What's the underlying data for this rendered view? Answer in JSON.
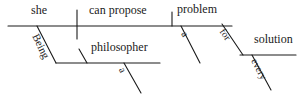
{
  "diagram": {
    "type": "reed-kellogg-sentence-diagram",
    "sentence": "Being a philosopher, she can propose a problem for every solution.",
    "ink_color": "#1a1a1a",
    "background_color": "#ffffff",
    "words": {
      "subject": "she",
      "verb": "can propose",
      "direct_object": "problem",
      "object_article": "a",
      "participle": "Being",
      "predicate_noun": "philosopher",
      "predicate_noun_article": "a",
      "preposition": "for",
      "prep_object": "solution",
      "prep_object_determiner": "every"
    }
  }
}
